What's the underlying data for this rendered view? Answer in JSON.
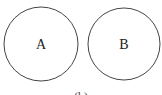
{
  "diagram": {
    "circles": [
      {
        "label": "A",
        "cx": 41,
        "cy": 44,
        "r": 37
      },
      {
        "label": "B",
        "cx": 124,
        "cy": 44,
        "r": 36
      }
    ],
    "caption": "(b)",
    "stroke_color": "#444444"
  }
}
